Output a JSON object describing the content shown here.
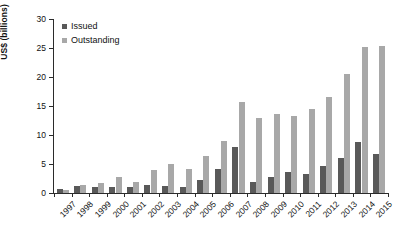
{
  "chart_data": {
    "type": "bar",
    "title": "",
    "xlabel": "",
    "ylabel": "US$ (billions)",
    "ylim": [
      0,
      30
    ],
    "yticks": [
      0,
      5,
      10,
      15,
      20,
      25,
      30
    ],
    "grid": false,
    "legend_position": "top-left",
    "categories": [
      "1997",
      "1998",
      "1999",
      "2000",
      "2001",
      "2002",
      "2003",
      "2004",
      "2005",
      "2006",
      "2007",
      "2008",
      "2009",
      "2010",
      "2011",
      "2012",
      "2013",
      "2014",
      "2015"
    ],
    "series": [
      {
        "name": "Issued",
        "color": "#595959",
        "values": [
          0.7,
          1.2,
          1.1,
          1.1,
          1.0,
          1.4,
          1.2,
          1.1,
          2.2,
          4.1,
          8.0,
          1.9,
          2.8,
          3.6,
          3.3,
          4.6,
          6.0,
          8.8,
          6.8
        ]
      },
      {
        "name": "Outstanding",
        "color": "#a8a8a8",
        "values": [
          0.6,
          1.4,
          1.8,
          2.8,
          1.9,
          3.9,
          5.0,
          4.1,
          6.3,
          9.0,
          15.7,
          13.0,
          13.6,
          13.2,
          14.4,
          16.6,
          20.5,
          25.2,
          25.3
        ]
      }
    ]
  },
  "legend": {
    "items": [
      {
        "label": "Issued",
        "swatch": "issued-swatch"
      },
      {
        "label": "Outstanding",
        "swatch": "outstanding-swatch"
      }
    ]
  }
}
